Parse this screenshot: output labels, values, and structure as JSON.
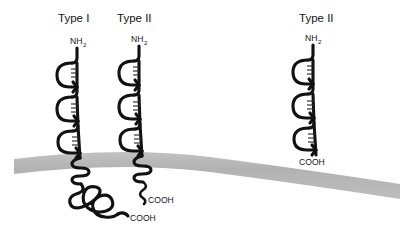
{
  "figure": {
    "background_color": "#ffffff",
    "chain_color": "#111111",
    "membrane_color": "#b4b4b4"
  },
  "membrane": {
    "name": "lipid bilayer",
    "color": "#b4b4b4",
    "thickness_px": 15,
    "left_y": 158,
    "right_y": 183,
    "curve": "shallow arc, higher in the middle-left, sloping down to the right"
  },
  "proteins": [
    {
      "id": "left",
      "type_label": "Type I",
      "n_terminus": "NH",
      "n_terminus_sub": "2",
      "c_terminus": "COOH",
      "n_terminus_side": "extracellular",
      "c_terminus_side": "cytoplasmic",
      "spans_membrane": true,
      "ectodomain_loops": 3,
      "disulfide_label": "S-S",
      "cytoplasmic_domain": "large globular tangled domain"
    },
    {
      "id": "middle",
      "type_label": "Type II",
      "n_terminus": "NH",
      "n_terminus_sub": "2",
      "c_terminus": "COOH",
      "n_terminus_side": "extracellular",
      "c_terminus_side": "cytoplasmic",
      "spans_membrane": true,
      "ectodomain_loops": 3,
      "disulfide_label": "S-S",
      "cytoplasmic_domain": "short tail"
    },
    {
      "id": "right",
      "type_label": "Type II",
      "n_terminus": "NH",
      "n_terminus_sub": "2",
      "c_terminus": "COOH",
      "n_terminus_side": "extracellular",
      "c_terminus_side": "extracellular",
      "spans_membrane": false,
      "ectodomain_loops": 3,
      "disulfide_label": "S-S",
      "cytoplasmic_domain": "none"
    }
  ]
}
